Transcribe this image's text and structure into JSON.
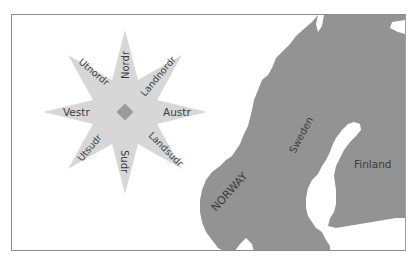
{
  "map": {
    "title": "",
    "colors": {
      "background": "#ffffff",
      "frame": "#8c8c8c",
      "land": "#939393",
      "compass_star": "#d7d7d7",
      "compass_center": "#9a9a9a",
      "label": "#3c3c3c"
    },
    "compass": {
      "directions": {
        "north": "Nordr",
        "northeast": "Landnordr",
        "east": "Austr",
        "southeast": "Landsudr",
        "south": "Sudr",
        "southwest": "Utsudr",
        "west": "Vestr",
        "northwest": "Utnordr"
      }
    },
    "countries": {
      "norway": "NORWAY",
      "sweden": "Sweden",
      "finland": "Finland"
    }
  }
}
